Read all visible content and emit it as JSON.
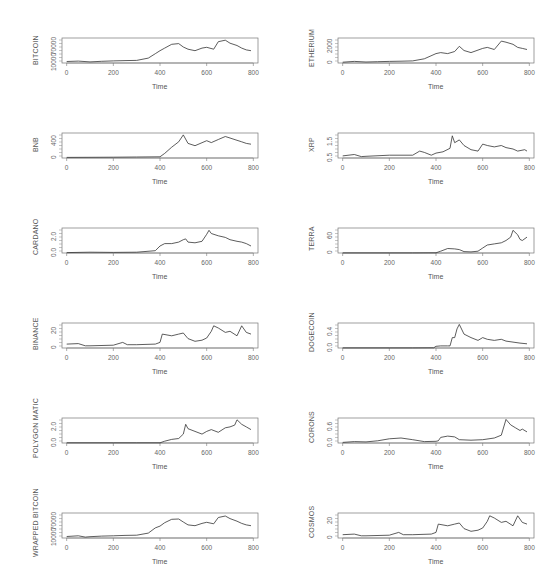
{
  "chart_data": [
    {
      "type": "line",
      "title": "",
      "ylabel": "BITCOIN",
      "xlabel": "Time",
      "xticks": [
        "0",
        "200",
        "400",
        "600",
        "800"
      ],
      "yticks": [
        "10000",
        "70000"
      ],
      "ylim": [
        5000,
        72000
      ],
      "x": [
        0,
        50,
        100,
        150,
        200,
        250,
        300,
        350,
        380,
        400,
        420,
        450,
        480,
        500,
        520,
        550,
        580,
        600,
        630,
        650,
        680,
        700,
        730,
        750,
        770,
        790
      ],
      "values": [
        9000,
        10000,
        8000,
        9500,
        10500,
        11500,
        12000,
        18000,
        30000,
        38000,
        45000,
        55000,
        57000,
        48000,
        42000,
        38000,
        45000,
        47000,
        42000,
        62000,
        66000,
        58000,
        52000,
        45000,
        40000,
        38000
      ]
    },
    {
      "type": "line",
      "ylabel": "ETHERIUM",
      "xlabel": "Time",
      "xticks": [
        "0",
        "200",
        "400",
        "600",
        "800"
      ],
      "yticks": [
        "0",
        "2000"
      ],
      "ylim": [
        0,
        4800
      ],
      "x": [
        0,
        50,
        100,
        150,
        200,
        250,
        300,
        350,
        400,
        420,
        450,
        480,
        500,
        520,
        550,
        600,
        620,
        650,
        680,
        700,
        730,
        750,
        770,
        790
      ],
      "values": [
        150,
        300,
        200,
        250,
        300,
        350,
        400,
        800,
        1800,
        2000,
        1800,
        2200,
        3200,
        2400,
        2000,
        2800,
        3000,
        2600,
        4200,
        4000,
        3600,
        3000,
        2800,
        2600
      ]
    },
    {
      "type": "line",
      "ylabel": "BNB",
      "xlabel": "Time",
      "xticks": [
        "0",
        "200",
        "400",
        "600",
        "800"
      ],
      "yticks": [
        "0",
        "400"
      ],
      "ylim": [
        0,
        650
      ],
      "x": [
        0,
        100,
        200,
        300,
        400,
        420,
        450,
        480,
        500,
        520,
        550,
        600,
        620,
        650,
        680,
        700,
        730,
        750,
        770,
        790
      ],
      "values": [
        15,
        18,
        20,
        25,
        30,
        120,
        280,
        420,
        600,
        380,
        320,
        450,
        400,
        480,
        560,
        520,
        460,
        420,
        380,
        360
      ]
    },
    {
      "type": "line",
      "ylabel": "XRP",
      "xlabel": "Time",
      "xticks": [
        "0",
        "200",
        "400",
        "600",
        "800"
      ],
      "yticks": [
        "0.5",
        "1.5"
      ],
      "ylim": [
        0.1,
        1.9
      ],
      "x": [
        0,
        50,
        80,
        100,
        200,
        300,
        330,
        350,
        380,
        400,
        430,
        460,
        470,
        480,
        500,
        520,
        550,
        580,
        600,
        620,
        650,
        680,
        700,
        730,
        750,
        780,
        790
      ],
      "values": [
        0.25,
        0.35,
        0.2,
        0.22,
        0.3,
        0.3,
        0.6,
        0.5,
        0.3,
        0.45,
        0.55,
        0.8,
        1.7,
        1.2,
        1.4,
        1.0,
        0.7,
        0.6,
        1.1,
        1.0,
        0.9,
        1.0,
        0.85,
        0.75,
        0.6,
        0.7,
        0.6
      ]
    },
    {
      "type": "line",
      "ylabel": "CARDANO",
      "xlabel": "Time",
      "xticks": [
        "0",
        "200",
        "400",
        "600",
        "800"
      ],
      "yticks": [
        "0.0",
        "2.0"
      ],
      "ylim": [
        0,
        3.2
      ],
      "x": [
        0,
        100,
        200,
        300,
        380,
        400,
        420,
        450,
        480,
        500,
        510,
        520,
        550,
        580,
        600,
        610,
        620,
        650,
        680,
        700,
        730,
        750,
        770,
        790
      ],
      "values": [
        0.05,
        0.1,
        0.08,
        0.1,
        0.3,
        0.9,
        1.2,
        1.2,
        1.4,
        1.7,
        1.8,
        1.4,
        1.3,
        1.5,
        2.4,
        2.9,
        2.5,
        2.2,
        2.0,
        1.7,
        1.5,
        1.4,
        1.2,
        0.9
      ]
    },
    {
      "type": "line",
      "ylabel": "TERRA",
      "xlabel": "Time",
      "xticks": [
        "0",
        "200",
        "400",
        "600",
        "800"
      ],
      "yticks": [
        "0",
        "60"
      ],
      "ylim": [
        0,
        110
      ],
      "x": [
        0,
        100,
        200,
        300,
        400,
        420,
        450,
        480,
        500,
        520,
        550,
        580,
        600,
        620,
        650,
        680,
        700,
        720,
        730,
        750,
        760,
        770,
        790
      ],
      "values": [
        0.5,
        0.5,
        0.5,
        0.5,
        1,
        8,
        20,
        18,
        15,
        6,
        5,
        8,
        22,
        35,
        40,
        45,
        55,
        70,
        100,
        80,
        60,
        55,
        70
      ]
    },
    {
      "type": "line",
      "ylabel": "BINANCE",
      "xlabel": "Time",
      "xticks": [
        "0",
        "200",
        "400",
        "600",
        "800"
      ],
      "yticks": [
        "0",
        "20"
      ],
      "ylim": [
        0,
        45
      ],
      "x": [
        0,
        50,
        80,
        100,
        200,
        240,
        260,
        300,
        380,
        400,
        410,
        450,
        480,
        500,
        520,
        550,
        580,
        600,
        620,
        630,
        650,
        680,
        700,
        730,
        750,
        770,
        790
      ],
      "values": [
        7,
        8,
        4,
        4,
        5,
        10,
        6,
        6,
        7,
        10,
        25,
        22,
        25,
        27,
        17,
        12,
        14,
        18,
        30,
        40,
        36,
        28,
        30,
        22,
        40,
        28,
        25
      ]
    },
    {
      "type": "line",
      "ylabel": "DOGECOIN",
      "xlabel": "Time",
      "xticks": [
        "0",
        "200",
        "400",
        "600",
        "800"
      ],
      "yticks": [
        "0.0",
        "0.4"
      ],
      "ylim": [
        0,
        0.72
      ],
      "x": [
        0,
        100,
        200,
        300,
        390,
        400,
        420,
        450,
        460,
        470,
        480,
        490,
        500,
        520,
        550,
        580,
        600,
        620,
        650,
        680,
        700,
        730,
        760,
        790
      ],
      "values": [
        0.003,
        0.003,
        0.003,
        0.004,
        0.005,
        0.05,
        0.06,
        0.06,
        0.06,
        0.3,
        0.3,
        0.55,
        0.68,
        0.4,
        0.3,
        0.22,
        0.3,
        0.25,
        0.22,
        0.25,
        0.2,
        0.17,
        0.14,
        0.12
      ]
    },
    {
      "type": "line",
      "ylabel": "POLYGON MATIC",
      "xlabel": "Time",
      "xticks": [
        "0",
        "200",
        "400",
        "600",
        "800"
      ],
      "yticks": [
        "0.0",
        "2.0"
      ],
      "ylim": [
        0,
        2.8
      ],
      "x": [
        0,
        100,
        200,
        300,
        400,
        420,
        450,
        480,
        500,
        510,
        520,
        550,
        580,
        600,
        620,
        650,
        680,
        700,
        720,
        730,
        750,
        770,
        790
      ],
      "values": [
        0.02,
        0.02,
        0.02,
        0.02,
        0.02,
        0.2,
        0.4,
        0.5,
        1.0,
        2.1,
        1.6,
        1.3,
        1.0,
        1.3,
        1.5,
        1.2,
        1.7,
        1.8,
        2.0,
        2.6,
        2.1,
        1.8,
        1.5
      ]
    },
    {
      "type": "line",
      "ylabel": "CORONS",
      "xlabel": "Time",
      "xticks": [
        "0",
        "200",
        "400",
        "600",
        "800"
      ],
      "yticks": [
        "0.0",
        "0.6"
      ],
      "ylim": [
        0,
        0.9
      ],
      "x": [
        0,
        50,
        100,
        150,
        200,
        250,
        300,
        350,
        400,
        410,
        420,
        450,
        480,
        500,
        550,
        600,
        650,
        680,
        700,
        720,
        740,
        760,
        770,
        790
      ],
      "values": [
        0.02,
        0.05,
        0.04,
        0.08,
        0.15,
        0.18,
        0.12,
        0.05,
        0.06,
        0.08,
        0.2,
        0.25,
        0.22,
        0.12,
        0.1,
        0.12,
        0.18,
        0.28,
        0.85,
        0.65,
        0.55,
        0.45,
        0.5,
        0.4
      ]
    },
    {
      "type": "line",
      "ylabel": "WRAPPED BITCOIN",
      "xlabel": "Time",
      "xticks": [
        "0",
        "200",
        "400",
        "600",
        "800"
      ],
      "yticks": [
        "10000",
        "70000"
      ],
      "ylim": [
        5000,
        72000
      ],
      "x": [
        0,
        50,
        80,
        100,
        150,
        200,
        250,
        300,
        350,
        380,
        400,
        420,
        450,
        480,
        500,
        520,
        550,
        580,
        600,
        630,
        650,
        680,
        700,
        730,
        750,
        770,
        790
      ],
      "values": [
        9000,
        11000,
        7500,
        8500,
        10000,
        11000,
        12000,
        12500,
        18000,
        32000,
        37000,
        46000,
        55000,
        56000,
        48000,
        40000,
        38000,
        44000,
        47000,
        43000,
        60000,
        64000,
        57000,
        50000,
        44000,
        40000,
        38000
      ]
    },
    {
      "type": "line",
      "ylabel": "COSMOS",
      "xlabel": "Time",
      "xticks": [
        "0",
        "200",
        "400",
        "600",
        "800"
      ],
      "yticks": [
        "0",
        "20"
      ],
      "ylim": [
        0,
        45
      ],
      "x": [
        0,
        50,
        80,
        100,
        200,
        240,
        260,
        300,
        380,
        400,
        410,
        450,
        480,
        500,
        520,
        550,
        580,
        600,
        620,
        630,
        650,
        680,
        700,
        730,
        750,
        770,
        790
      ],
      "values": [
        6,
        7,
        4,
        4,
        5,
        10,
        6,
        6,
        7,
        10,
        25,
        22,
        25,
        27,
        17,
        12,
        14,
        18,
        30,
        40,
        36,
        28,
        30,
        22,
        40,
        28,
        25
      ]
    }
  ]
}
